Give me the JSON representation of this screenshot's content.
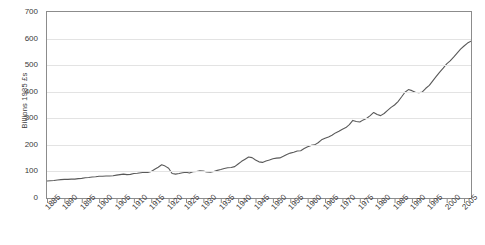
{
  "chart_data": {
    "type": "line",
    "title": "",
    "subtitle": "",
    "xlabel": "",
    "ylabel": "Billions 1985 £s",
    "xlim": [
      1885,
      2007
    ],
    "ylim": [
      0,
      700
    ],
    "grid": true,
    "legend": false,
    "legend_position": "none",
    "line_color": "#595959",
    "y_ticks": [
      0,
      100,
      200,
      300,
      400,
      500,
      600,
      700
    ],
    "y_tick_labels": [
      "0",
      "100",
      "200",
      "300",
      "400",
      "500",
      "600",
      "700"
    ],
    "x_ticks": [
      1885,
      1890,
      1895,
      1900,
      1905,
      1910,
      1915,
      1920,
      1925,
      1930,
      1935,
      1940,
      1945,
      1950,
      1955,
      1960,
      1965,
      1970,
      1975,
      1980,
      1985,
      1990,
      1995,
      2000,
      2005
    ],
    "x_tick_labels": [
      "1885",
      "1890",
      "1895",
      "1900",
      "1905",
      "1910",
      "1915",
      "1920",
      "1925",
      "1930",
      "1935",
      "1940",
      "1945",
      "1950",
      "1955",
      "1960",
      "1965",
      "1970",
      "1975",
      "1980",
      "1985",
      "1990",
      "1995",
      "2000",
      "2005"
    ],
    "series": [
      {
        "name": "",
        "x": [
          1885,
          1886,
          1887,
          1888,
          1889,
          1890,
          1891,
          1892,
          1893,
          1894,
          1895,
          1896,
          1897,
          1898,
          1899,
          1900,
          1901,
          1902,
          1903,
          1904,
          1905,
          1906,
          1907,
          1908,
          1909,
          1910,
          1911,
          1912,
          1913,
          1914,
          1915,
          1916,
          1917,
          1918,
          1919,
          1920,
          1921,
          1922,
          1923,
          1924,
          1925,
          1926,
          1927,
          1928,
          1929,
          1930,
          1931,
          1932,
          1933,
          1934,
          1935,
          1936,
          1937,
          1938,
          1939,
          1940,
          1941,
          1942,
          1943,
          1944,
          1945,
          1946,
          1947,
          1948,
          1949,
          1950,
          1951,
          1952,
          1953,
          1954,
          1955,
          1956,
          1957,
          1958,
          1959,
          1960,
          1961,
          1962,
          1963,
          1964,
          1965,
          1966,
          1967,
          1968,
          1969,
          1970,
          1971,
          1972,
          1973,
          1974,
          1975,
          1976,
          1977,
          1978,
          1979,
          1980,
          1981,
          1982,
          1983,
          1984,
          1985,
          1986,
          1987,
          1988,
          1989,
          1990,
          1991,
          1992,
          1993,
          1994,
          1995,
          1996,
          1997,
          1998,
          1999,
          2000,
          2001,
          2002,
          2003,
          2004,
          2005,
          2006,
          2007
        ],
        "values": [
          64,
          65,
          66,
          68,
          69,
          70,
          70,
          71,
          71,
          73,
          74,
          76,
          77,
          79,
          80,
          82,
          82,
          83,
          83,
          84,
          86,
          88,
          90,
          88,
          89,
          92,
          93,
          95,
          97,
          96,
          100,
          108,
          116,
          125,
          120,
          112,
          92,
          90,
          92,
          95,
          97,
          94,
          99,
          100,
          102,
          101,
          98,
          97,
          100,
          104,
          107,
          111,
          114,
          115,
          118,
          128,
          138,
          146,
          154,
          152,
          143,
          136,
          134,
          139,
          143,
          148,
          150,
          151,
          157,
          164,
          169,
          172,
          177,
          178,
          186,
          193,
          198,
          200,
          208,
          219,
          225,
          230,
          236,
          245,
          251,
          259,
          265,
          276,
          292,
          288,
          286,
          294,
          300,
          310,
          322,
          314,
          310,
          318,
          330,
          341,
          350,
          363,
          380,
          398,
          408,
          404,
          398,
          396,
          399,
          413,
          424,
          441,
          458,
          474,
          489,
          505,
          516,
          530,
          545,
          560,
          572,
          583,
          590
        ]
      }
    ]
  }
}
